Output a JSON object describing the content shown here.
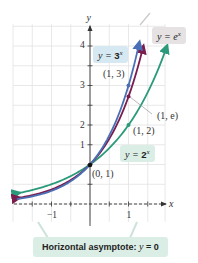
{
  "chart_data": {
    "type": "line",
    "title": "",
    "xlabel": "x",
    "ylabel": "y",
    "xlim": [
      -2,
      1.95
    ],
    "ylim": [
      -0.45,
      4.55
    ],
    "grid": true,
    "x_ticks": [
      -1.5,
      -1,
      -0.5,
      0.5,
      1,
      1.5
    ],
    "x_tick_labels": [
      {
        "value": -1,
        "label": "−1"
      },
      {
        "value": 1,
        "label": "1"
      }
    ],
    "y_ticks": [
      0.5,
      1,
      1.5,
      2,
      2.5,
      3,
      3.5,
      4
    ],
    "y_tick_labels": [
      {
        "value": 1,
        "label": "1"
      },
      {
        "value": 2,
        "label": "2"
      },
      {
        "value": 3,
        "label": "3"
      },
      {
        "value": 4,
        "label": "4"
      }
    ],
    "series": [
      {
        "name": "y = 3^x",
        "function": "3^x",
        "color": "#4a6fb5",
        "x_range": [
          -1.9,
          1.27
        ]
      },
      {
        "name": "y = e^x",
        "function": "e^x",
        "color": "#7a1d4f",
        "x_range": [
          -1.9,
          1.37
        ]
      },
      {
        "name": "y = 2^x",
        "function": "2^x",
        "color": "#2a9a7a",
        "x_range": [
          -1.9,
          1.98
        ]
      }
    ],
    "points": [
      {
        "x": 0,
        "y": 1,
        "label": "(0, 1)",
        "color": "#111111"
      },
      {
        "x": 1,
        "y": 3,
        "label": "(1, 3)",
        "color": "#4a6fb5"
      },
      {
        "x": 1,
        "y": 2.718,
        "label": "(1, e)",
        "color": "#7a1d4f"
      },
      {
        "x": 1,
        "y": 2,
        "label": "(1, 2)",
        "color": "#2a9a7a"
      }
    ],
    "annotations": [
      {
        "text": "y = 3^x",
        "target": "3^x curve"
      },
      {
        "text": "y = e^x",
        "target": "e^x curve"
      },
      {
        "text": "y = 2^x",
        "target": "2^x curve"
      },
      {
        "text": "Horizontal asymptote: y = 0",
        "target": "x-axis (dashed)"
      }
    ],
    "asymptote": {
      "type": "horizontal",
      "y": 0,
      "style": "dashed"
    }
  },
  "labels": {
    "axis_x": "x",
    "axis_y": "y",
    "tick_neg1": "−1",
    "tick_pos1": "1",
    "tick_y1": "1",
    "tick_y2": "2",
    "tick_y3": "3",
    "tick_y4": "4",
    "pt_01": "(0, 1)",
    "pt_13": "(1, 3)",
    "pt_1e": "(1, e)",
    "pt_12": "(1, 2)",
    "callout_3x_prefix": "y = ",
    "callout_3x_base": "3",
    "callout_3x_exp": "x",
    "callout_ex_prefix": "y = ",
    "callout_ex_base": "e",
    "callout_ex_exp": "x",
    "callout_2x_prefix": "y = ",
    "callout_2x_base": "2",
    "callout_2x_exp": "x",
    "asymptote_label": "Horizontal asymptote: ",
    "asymptote_eq_var": "y",
    "asymptote_eq_rest": " = 0"
  },
  "colors": {
    "three_x": "#4a6fb5",
    "e_x": "#7a1d4f",
    "two_x": "#2a9a7a",
    "grid": "#e2e2e2",
    "callout_blue": "#d6e8f2",
    "callout_gray": "#e6e2e4",
    "callout_green": "#dbeee6"
  }
}
